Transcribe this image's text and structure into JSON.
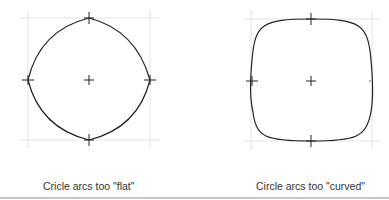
{
  "figures": [
    {
      "id": "flat",
      "caption": "Cricle arcs too \"flat\"",
      "center": [
        89,
        80
      ],
      "half_size": 61,
      "shape": "arcs-too-flat"
    },
    {
      "id": "curved",
      "caption": "Circle arcs too \"curved\"",
      "center": [
        311,
        81
      ],
      "half_size": 60,
      "shape": "arcs-too-curved"
    }
  ],
  "colors": {
    "stroke": "#222222",
    "grid": "#dddddd",
    "rule": "#c8c8c8"
  }
}
